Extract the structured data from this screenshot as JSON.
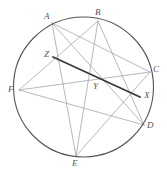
{
  "figure": {
    "canvas": {
      "width": 167,
      "height": 174,
      "background": "#ffffff"
    },
    "circle": {
      "name": "main-circle",
      "cx": 83.5,
      "cy": 87,
      "r": 70,
      "stroke": "#555558",
      "stroke_width": 1.1,
      "fill": "none"
    },
    "style": {
      "chord_stroke": "#9a9aa0",
      "chord_stroke_width": 0.7,
      "highlight_stroke": "#3a3a42",
      "highlight_stroke_width": 1.9,
      "label_color": "#55555a",
      "label_font_size": 9
    },
    "points": [
      {
        "id": "A",
        "label": "A",
        "x": 52,
        "y": 23,
        "on_circle": true,
        "label_x": 44,
        "label_y": 12
      },
      {
        "id": "B",
        "label": "B",
        "x": 98,
        "y": 21,
        "on_circle": true,
        "label_x": 95,
        "label_y": 8
      },
      {
        "id": "C",
        "label": "C",
        "x": 150,
        "y": 72,
        "on_circle": true,
        "label_x": 153,
        "label_y": 65
      },
      {
        "id": "D",
        "label": "D",
        "x": 144,
        "y": 125,
        "on_circle": true,
        "label_x": 147,
        "label_y": 121
      },
      {
        "id": "E",
        "label": "E",
        "x": 76,
        "y": 156,
        "on_circle": true,
        "label_x": 72,
        "label_y": 159
      },
      {
        "id": "F",
        "label": "F",
        "x": 19,
        "y": 90,
        "on_circle": true,
        "label_x": 8,
        "label_y": 85
      },
      {
        "id": "X",
        "label": "X",
        "x": 140,
        "y": 97,
        "on_circle": false,
        "label_x": 144,
        "label_y": 91
      },
      {
        "id": "Y",
        "label": "Y",
        "x": 98,
        "y": 86,
        "on_circle": false,
        "label_x": 93,
        "label_y": 82
      },
      {
        "id": "Z",
        "label": "Z",
        "x": 53,
        "y": 57,
        "on_circle": false,
        "label_x": 44,
        "label_y": 50
      }
    ],
    "chords": [
      {
        "id": "chord-A-D",
        "from": "A",
        "to": "D",
        "highlight": false
      },
      {
        "id": "chord-A-C",
        "from": "A",
        "to": "C",
        "highlight": false
      },
      {
        "id": "chord-A-E",
        "from": "A",
        "to": "E",
        "highlight": false
      },
      {
        "id": "chord-B-F",
        "from": "B",
        "to": "F",
        "highlight": false
      },
      {
        "id": "chord-B-E",
        "from": "B",
        "to": "E",
        "highlight": false
      },
      {
        "id": "chord-B-D",
        "from": "B",
        "to": "D",
        "highlight": false
      },
      {
        "id": "chord-C-F",
        "from": "C",
        "to": "F",
        "highlight": false
      },
      {
        "id": "chord-C-E",
        "from": "C",
        "to": "E",
        "highlight": false
      },
      {
        "id": "chord-D-F",
        "from": "D",
        "to": "F",
        "highlight": false
      },
      {
        "id": "segment-Z-X",
        "from": "Z",
        "to": "X",
        "highlight": true
      }
    ]
  }
}
